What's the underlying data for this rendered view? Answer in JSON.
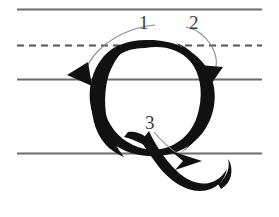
{
  "diagram": {
    "letter": "Q",
    "script_style": "cursive-capital",
    "colors": {
      "ink": "#111111",
      "rule_line": "#6b6b6b",
      "dashed_line": "#555555",
      "guide_arc": "#8a8a8a",
      "label_text": "#3a3a3a",
      "background": "#ffffff"
    },
    "guide_lines": [
      {
        "name": "ascender-line",
        "style": "solid",
        "y": 9,
        "x1": 17,
        "x2": 262
      },
      {
        "name": "midline",
        "style": "dashed",
        "y": 45,
        "x1": 17,
        "x2": 262
      },
      {
        "name": "baseline",
        "style": "solid",
        "y": 79,
        "x1": 17,
        "x2": 262
      },
      {
        "name": "descender-line",
        "style": "solid",
        "y": 153,
        "x1": 17,
        "x2": 262
      }
    ],
    "strokes": [
      {
        "number": "1",
        "label": "1",
        "label_x": 139,
        "label_y": 13,
        "description": "Curve left and down from the midline to the baseline",
        "arrow_tip": {
          "x": 78,
          "y": 84
        },
        "direction": "down-left"
      },
      {
        "number": "2",
        "label": "2",
        "label_x": 189,
        "label_y": 13,
        "description": "Curve right and down along the outside of the oval to the baseline",
        "arrow_tip": {
          "x": 208,
          "y": 86
        },
        "direction": "down"
      },
      {
        "number": "3",
        "label": "3",
        "label_x": 145,
        "label_y": 113,
        "description": "Sweep the tail down and out to the right below the baseline",
        "arrow_tip": {
          "x": 200,
          "y": 163
        },
        "direction": "right-down"
      }
    ]
  }
}
